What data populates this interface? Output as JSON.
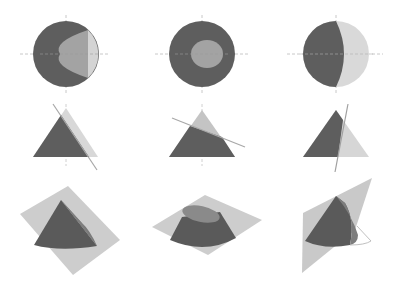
{
  "figure": {
    "columns": [
      {
        "id": "col-1",
        "label": "oblique-cut-parabola"
      },
      {
        "id": "col-2",
        "label": "horizontal-cut-circle"
      },
      {
        "id": "col-3",
        "label": "steep-cut-hyperbola"
      }
    ],
    "rows": [
      {
        "id": "row-top",
        "label": "top-view"
      },
      {
        "id": "row-side",
        "label": "side-view"
      },
      {
        "id": "row-3d",
        "label": "perspective-view"
      }
    ],
    "colors": {
      "dark": "#5a5a5a",
      "mid": "#8a8a8a",
      "light": "#b8b8b8",
      "lighter": "#d6d6d6",
      "plane": "#c4c4c4",
      "axis": "#c8c8c8",
      "background": "#ffffff"
    }
  }
}
